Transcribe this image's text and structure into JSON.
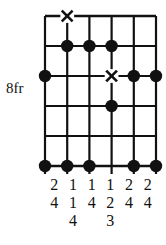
{
  "diagram": {
    "kind": "guitar-fretboard-diagram",
    "position_label": "8fr",
    "strings": 6,
    "fret_lines": 6,
    "fret_spaces": 5,
    "colors": {
      "line": "#111111",
      "dot": "#111111",
      "cross": "#111111",
      "background": "#ffffff"
    },
    "markers": [
      {
        "type": "cross",
        "string": 2,
        "line": 1
      },
      {
        "type": "dot",
        "string": 2,
        "line": 2
      },
      {
        "type": "dot",
        "string": 3,
        "line": 2
      },
      {
        "type": "dot",
        "string": 4,
        "line": 2
      },
      {
        "type": "dot",
        "string": 1,
        "line": 3
      },
      {
        "type": "cross",
        "string": 4,
        "line": 3
      },
      {
        "type": "dot",
        "string": 5,
        "line": 3
      },
      {
        "type": "dot",
        "string": 6,
        "line": 3
      },
      {
        "type": "dot",
        "string": 4,
        "line": 4
      },
      {
        "type": "dot",
        "string": 1,
        "line": 6
      },
      {
        "type": "dot",
        "string": 2,
        "line": 6
      },
      {
        "type": "dot",
        "string": 3,
        "line": 6
      },
      {
        "type": "dot",
        "string": 5,
        "line": 6
      },
      {
        "type": "dot",
        "string": 6,
        "line": 6
      }
    ],
    "finger_columns": [
      {
        "string": 1,
        "numbers": [
          "2",
          "4"
        ]
      },
      {
        "string": 2,
        "numbers": [
          "1",
          "1",
          "4"
        ]
      },
      {
        "string": 3,
        "numbers": [
          "1",
          "4"
        ]
      },
      {
        "string": 4,
        "numbers": [
          "1",
          "2",
          "3"
        ]
      },
      {
        "string": 5,
        "numbers": [
          "2",
          "4"
        ]
      },
      {
        "string": 6,
        "numbers": [
          "2",
          "4"
        ]
      }
    ]
  }
}
